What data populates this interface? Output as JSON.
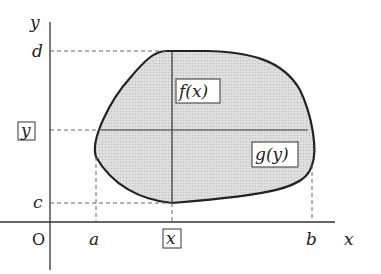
{
  "diagram": {
    "type": "region-between-curves",
    "axes": {
      "x_label": "x",
      "y_label": "y",
      "origin_label": "O"
    },
    "x_ticks": {
      "a": "a",
      "x": "x",
      "b": "b"
    },
    "y_ticks": {
      "c": "c",
      "y": "y",
      "d": "d"
    },
    "boxed_labels": {
      "x": "x",
      "y": "y",
      "f": "f(x)",
      "g": "g(y)"
    },
    "colors": {
      "fill": "#d4d4d4",
      "stroke": "#222222",
      "guide": "#666666"
    }
  }
}
